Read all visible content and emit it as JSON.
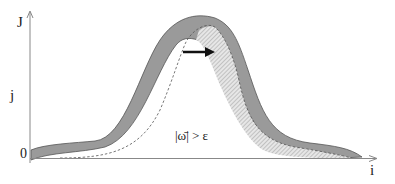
{
  "diagram": {
    "axes": {
      "y_label_top": "J",
      "y_label_mid": "j",
      "origin_label": "0",
      "x_label": "i"
    },
    "annotation": "|ω̄| > ε",
    "colors": {
      "band_fill": "#9a9a9a",
      "band_stroke": "#555555",
      "hatch_fill": "#d8d8d8",
      "axis": "#888888",
      "arrow": "#111111",
      "dashed": "#555555"
    }
  }
}
